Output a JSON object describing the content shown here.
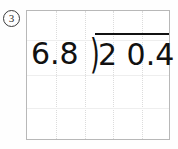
{
  "problem": {
    "number_label": "3",
    "type": "long-division",
    "divisor": "6.8",
    "dividend": "2 0.4",
    "dividend_value": "20.4",
    "division_symbol": ")",
    "quotient": ""
  },
  "worksheet": {
    "grid": {
      "columns": 5,
      "rows": 4,
      "vertical_line_positions": [
        29,
        58,
        86,
        115
      ],
      "horizontal_line_positions": [
        29,
        64,
        97
      ],
      "border_color": "#b8b8b8",
      "grid_line_color": "#dcdcdc"
    },
    "ink_color": "#111111"
  }
}
